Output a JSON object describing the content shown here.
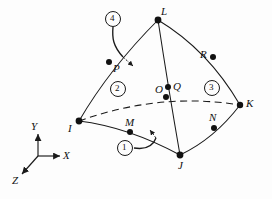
{
  "figure": {
    "background": "#fdfdfd",
    "stroke": "#1a1a1a"
  },
  "axes": {
    "origin": {
      "x": 38,
      "y": 156
    },
    "labels": {
      "x": "X",
      "y": "Y",
      "z": "Z"
    },
    "x_tip": {
      "x": 62,
      "y": 156
    },
    "y_tip": {
      "x": 38,
      "y": 132
    },
    "z_tip": {
      "x": 20,
      "y": 176
    }
  },
  "vertices": [
    {
      "id": "I",
      "label": "I",
      "x": 79,
      "y": 121,
      "lx": 68,
      "ly": 123
    },
    {
      "id": "J",
      "label": "J",
      "x": 180,
      "y": 155,
      "lx": 178,
      "ly": 160
    },
    {
      "id": "K",
      "label": "K",
      "x": 240,
      "y": 105,
      "lx": 246,
      "ly": 101
    },
    {
      "id": "L",
      "label": "L",
      "x": 158,
      "y": 20,
      "lx": 161,
      "ly": 9
    }
  ],
  "midside_nodes": [
    {
      "id": "M",
      "label": "M",
      "x": 130,
      "y": 132,
      "lx": 125,
      "ly": 119
    },
    {
      "id": "N",
      "label": "N",
      "x": 214,
      "y": 128,
      "lx": 209,
      "ly": 114
    },
    {
      "id": "O",
      "label": "O",
      "x": 166,
      "y": 97,
      "lx": 157,
      "ly": 85
    },
    {
      "id": "P",
      "label": "P",
      "x": 109,
      "y": 62,
      "lx": 113,
      "ly": 64
    },
    {
      "id": "Q",
      "label": "Q",
      "x": 168,
      "y": 87,
      "lx": 173,
      "ly": 84
    },
    {
      "id": "R",
      "label": "R",
      "x": 213,
      "y": 57,
      "lx": 201,
      "ly": 53
    }
  ],
  "face_labels": [
    {
      "id": "face-1",
      "text": "1",
      "x": 125,
      "y": 148
    },
    {
      "id": "face-2",
      "text": "2",
      "x": 118,
      "y": 89
    },
    {
      "id": "face-3",
      "text": "3",
      "x": 212,
      "y": 88
    },
    {
      "id": "face-4",
      "text": "4",
      "x": 113,
      "y": 19
    }
  ]
}
